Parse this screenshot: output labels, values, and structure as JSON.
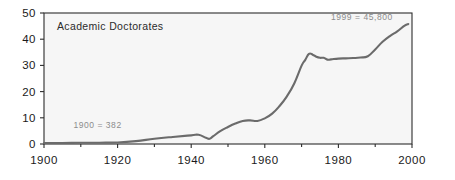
{
  "chart_data": {
    "type": "line",
    "title": "Academic Doctorates",
    "xlabel": "",
    "ylabel": "",
    "xlim": [
      1900,
      2000
    ],
    "ylim": [
      0,
      50
    ],
    "grid": false,
    "legend": "none",
    "x_ticks": [
      "1900",
      "1920",
      "1940",
      "1960",
      "1980",
      "2000"
    ],
    "x_tick_values": [
      1900,
      1920,
      1940,
      1960,
      1980,
      2000
    ],
    "x_minor_tick_values": [
      1910,
      1930,
      1950,
      1970,
      1990
    ],
    "y_ticks": [
      "0",
      "10",
      "20",
      "30",
      "40",
      "50"
    ],
    "y_tick_values": [
      0,
      10,
      20,
      30,
      40,
      50
    ],
    "units_note": "thousands",
    "annotations": [
      {
        "text": "1900 = 382",
        "x": 1908,
        "y": 6.0
      },
      {
        "text": "1999 = 45,800",
        "x": 1978,
        "y": 47.2
      }
    ],
    "series": [
      {
        "name": "Academic Doctorates",
        "color": "#6b6b6b",
        "x": [
          1900,
          1905,
          1910,
          1915,
          1920,
          1925,
          1930,
          1935,
          1940,
          1942,
          1944,
          1945,
          1946,
          1948,
          1950,
          1952,
          1954,
          1956,
          1958,
          1960,
          1962,
          1964,
          1966,
          1968,
          1970,
          1971,
          1972,
          1973,
          1974,
          1975,
          1976,
          1977,
          1978,
          1980,
          1982,
          1984,
          1986,
          1988,
          1990,
          1992,
          1994,
          1996,
          1998,
          1999
        ],
        "values": [
          0.38,
          0.4,
          0.45,
          0.5,
          0.6,
          1.1,
          2.0,
          2.7,
          3.3,
          3.5,
          2.4,
          2.0,
          3.0,
          5.0,
          6.5,
          7.8,
          8.8,
          9.0,
          8.8,
          9.8,
          11.6,
          14.5,
          18.2,
          23.1,
          29.9,
          32.1,
          34.4,
          34.1,
          33.3,
          32.9,
          32.9,
          32.2,
          32.3,
          32.6,
          32.7,
          32.8,
          33.0,
          33.5,
          36.1,
          39.0,
          41.2,
          43.0,
          45.2,
          45.8
        ]
      }
    ]
  },
  "chart_title": "Academic Doctorates",
  "annotation_start": "1900 = 382",
  "annotation_end": "1999 = 45,800",
  "axis": {
    "x_labels": [
      "1900",
      "1920",
      "1940",
      "1960",
      "1980",
      "2000"
    ],
    "y_labels": [
      "0",
      "10",
      "20",
      "30",
      "40",
      "50"
    ]
  },
  "colors": {
    "line": "#6b6b6b",
    "axis": "#2c2c2c",
    "plot_background": "#f6f6f6",
    "page_background": "#ffffff",
    "title_text": "#2b2b2b",
    "annotation_text": "#8c8c8c",
    "tick_text": "#1a1a1a"
  }
}
